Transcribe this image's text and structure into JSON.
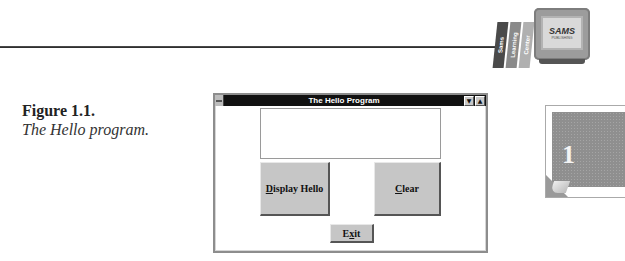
{
  "page": {
    "logo": {
      "spines": [
        "Sams",
        "Learning",
        "Center"
      ],
      "spine_colors": [
        "#4a4a4a",
        "#8a8a8a",
        "#b0b0b0"
      ],
      "brand": "SAMS",
      "brand_sub": "PUBLISHING"
    },
    "chapter_number": "1"
  },
  "figure": {
    "label": "Figure 1.1.",
    "description": "The Hello program."
  },
  "window": {
    "title": "The Hello Program",
    "minimize_glyph": "▼",
    "maximize_glyph": "▲",
    "textbox_value": "",
    "buttons": {
      "display_hello": {
        "mnemonic": "D",
        "rest": "isplay Hello"
      },
      "clear": {
        "mnemonic": "C",
        "rest": "lear"
      },
      "exit": {
        "pre": "E",
        "mnemonic": "x",
        "rest": "it"
      }
    }
  }
}
